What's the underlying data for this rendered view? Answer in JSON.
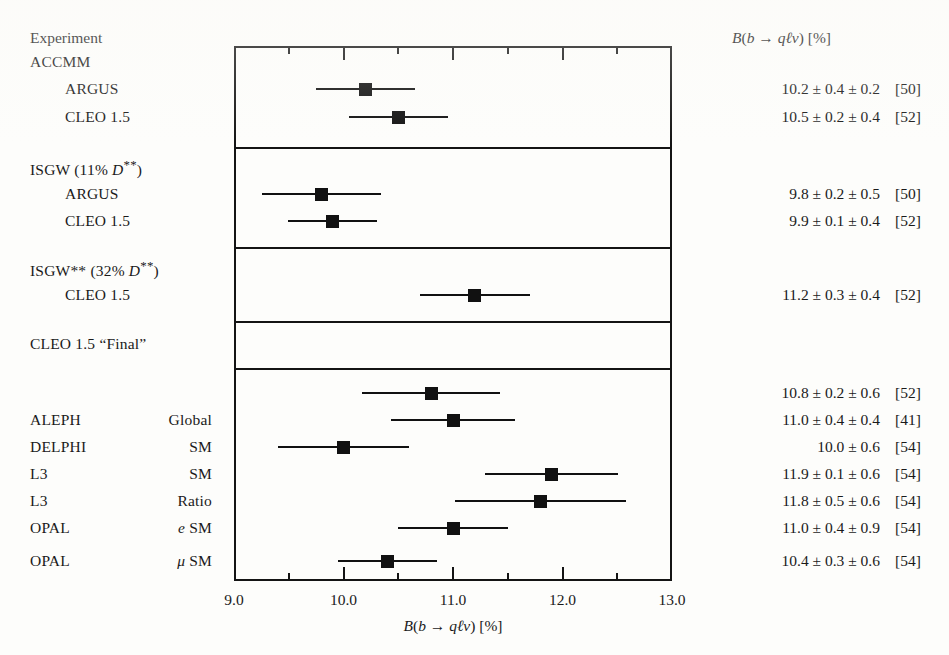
{
  "figure": {
    "left_header": "Experiment",
    "right_header": "B(b → qℓν)  [%]",
    "xaxis_title": "B(b → qℓν)  [%]",
    "background_color": "#fdfdfb",
    "ink_color": "#141414"
  },
  "axis": {
    "min": 9.0,
    "max": 13.0,
    "tick_labels": [
      "9.0",
      "10.0",
      "11.0",
      "12.0",
      "13.0"
    ],
    "major_ticks": [
      9.0,
      10.0,
      11.0,
      12.0,
      13.0
    ],
    "minor_ticks": [
      9.5,
      10.5,
      11.5,
      12.5
    ]
  },
  "chart_data": {
    "type": "scatter",
    "title": "",
    "subtitle": "",
    "xlabel": "B(b → qℓν)  [%]",
    "ylabel": "Experiment",
    "xlim": [
      9.0,
      13.0
    ],
    "grid": false,
    "legend": "none",
    "orientation": "horizontal-forest-plot",
    "column_headers": [
      "Experiment",
      "B(b → qℓν)  [%]"
    ],
    "groups": [
      {
        "group_label": "ACCMM",
        "group_label_math": false,
        "rows": [
          {
            "label": "ARGUS",
            "indent": 1,
            "value": 10.2,
            "errors": [
              0.4,
              0.2
            ],
            "total_error": 0.45,
            "value_text": "10.2 ± 0.4 ± 0.2",
            "reference": "[50]",
            "has_marker": true
          },
          {
            "label": "CLEO 1.5",
            "indent": 1,
            "value": 10.5,
            "errors": [
              0.2,
              0.4
            ],
            "total_error": 0.45,
            "value_text": "10.5 ± 0.2 ± 0.4",
            "reference": "[52]",
            "has_marker": true
          }
        ]
      },
      {
        "group_label": "ISGW   (11% D**)",
        "group_label_math": true,
        "rows": [
          {
            "label": "ARGUS",
            "indent": 1,
            "value": 9.8,
            "errors": [
              0.2,
              0.5
            ],
            "total_error": 0.54,
            "value_text": "9.8 ± 0.2 ± 0.5",
            "reference": "[50]",
            "has_marker": true
          },
          {
            "label": "CLEO 1.5",
            "indent": 1,
            "value": 9.9,
            "errors": [
              0.1,
              0.4
            ],
            "total_error": 0.41,
            "value_text": "9.9 ± 0.1 ± 0.4",
            "reference": "[52]",
            "has_marker": true
          }
        ]
      },
      {
        "group_label": "ISGW** (32% D**)",
        "group_label_math": true,
        "rows": [
          {
            "label": "CLEO 1.5",
            "indent": 1,
            "value": 11.2,
            "errors": [
              0.3,
              0.4
            ],
            "total_error": 0.5,
            "value_text": "11.2 ± 0.3 ± 0.4",
            "reference": "[52]",
            "has_marker": true
          }
        ]
      },
      {
        "group_label": "CLEO 1.5  “Final”",
        "group_label_math": false,
        "rows": [
          {
            "label": "",
            "indent": 0,
            "value": 10.8,
            "errors": [
              0.2,
              0.6
            ],
            "total_error": 0.63,
            "value_text": "10.8 ± 0.2 ± 0.6",
            "reference": "[52]",
            "has_marker": true
          }
        ]
      },
      {
        "group_label": "",
        "group_label_math": false,
        "rows": [
          {
            "label": "ALEPH",
            "qualifier": "Global",
            "indent": 0,
            "value": 11.0,
            "errors": [
              0.4,
              0.4
            ],
            "total_error": 0.57,
            "value_text": "11.0 ± 0.4 ± 0.4",
            "reference": "[41]",
            "has_marker": true
          },
          {
            "label": "DELPHI",
            "qualifier": "SM",
            "indent": 0,
            "value": 10.0,
            "errors": [
              0.6
            ],
            "total_error": 0.6,
            "value_text": "10.0 ± 0.6",
            "reference": "[54]",
            "has_marker": true
          },
          {
            "label": "L3",
            "qualifier": "SM",
            "indent": 0,
            "value": 11.9,
            "errors": [
              0.1,
              0.6
            ],
            "total_error": 0.61,
            "value_text": "11.9 ± 0.1 ± 0.6",
            "reference": "[54]",
            "has_marker": true
          },
          {
            "label": "L3",
            "qualifier": "Ratio",
            "indent": 0,
            "value": 11.8,
            "errors": [
              0.5,
              0.6
            ],
            "total_error": 0.78,
            "value_text": "11.8 ± 0.5 ± 0.6",
            "reference": "[54]",
            "has_marker": true
          },
          {
            "label": "OPAL",
            "qualifier": "e SM",
            "qualifier_math": "e",
            "indent": 0,
            "value": 11.0,
            "errors": [
              0.4,
              0.9
            ],
            "total_error": 0.5,
            "value_text": "11.0 ± 0.4 ± 0.9",
            "reference": "[54]",
            "has_marker": true
          },
          {
            "label": "OPAL",
            "qualifier": "μ SM",
            "qualifier_math": "μ",
            "indent": 0,
            "value": 10.4,
            "errors": [
              0.3,
              0.6
            ],
            "total_error": 0.45,
            "value_text": "10.4 ± 0.3 ± 0.6",
            "reference": "[54]",
            "has_marker": true
          },
          {
            "label": "LEP Average",
            "qualifier": "",
            "indent": 0,
            "value": 11.0,
            "errors": [
              0.5
            ],
            "total_error": 0.5,
            "value_text": "11.0 ± 0.5",
            "reference": "",
            "has_marker": true,
            "is_average": true
          }
        ]
      }
    ]
  },
  "layout": {
    "plot_left_px": 234,
    "plot_right_px": 672,
    "plot_top_px": 46,
    "plot_bottom_px": 581,
    "section_divider_y": [
      147,
      247,
      321,
      368
    ],
    "left_label_x": 30,
    "left_indent_x": 65,
    "qualifier_x": 130,
    "value_right_x": 880,
    "ref_x": 895,
    "header_y": 30,
    "rows": [
      {
        "key": "accmm-group",
        "y": 62,
        "kind": "group"
      },
      {
        "key": "argus-accmm",
        "y": 89,
        "kind": "row"
      },
      {
        "key": "cleo-accmm",
        "y": 117,
        "kind": "row"
      },
      {
        "key": "isgw-group",
        "y": 167,
        "kind": "group"
      },
      {
        "key": "argus-isgw",
        "y": 194,
        "kind": "row"
      },
      {
        "key": "cleo-isgw",
        "y": 221,
        "kind": "row"
      },
      {
        "key": "isgw2-group",
        "y": 268,
        "kind": "group"
      },
      {
        "key": "cleo-isgw2",
        "y": 295,
        "kind": "row"
      },
      {
        "key": "cleo-final",
        "y": 344,
        "kind": "row"
      },
      {
        "key": "aleph-global",
        "y": 393,
        "kind": "row"
      },
      {
        "key": "delphi-sm",
        "y": 420,
        "kind": "row"
      },
      {
        "key": "l3-sm",
        "y": 447,
        "kind": "row"
      },
      {
        "key": "l3-ratio",
        "y": 474,
        "kind": "row"
      },
      {
        "key": "opal-e",
        "y": 501,
        "kind": "row"
      },
      {
        "key": "opal-mu",
        "y": 528,
        "kind": "row"
      },
      {
        "key": "lep-average",
        "y": 561,
        "kind": "row"
      }
    ]
  }
}
